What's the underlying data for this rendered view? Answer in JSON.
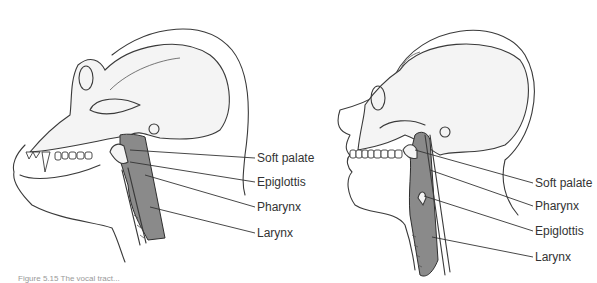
{
  "figure": {
    "panels": [
      {
        "id": "chimpanzee",
        "subject": "Chimpanzee head, sagittal view",
        "labels": [
          {
            "text": "Soft palate",
            "x": 257,
            "y": 152
          },
          {
            "text": "Epiglottis",
            "x": 257,
            "y": 176
          },
          {
            "text": "Pharynx",
            "x": 257,
            "y": 201
          },
          {
            "text": "Larynx",
            "x": 257,
            "y": 227
          }
        ]
      },
      {
        "id": "human",
        "subject": "Human head, sagittal view",
        "labels": [
          {
            "text": "Soft palate",
            "x": 535,
            "y": 177
          },
          {
            "text": "Pharynx",
            "x": 535,
            "y": 200
          },
          {
            "text": "Epiglottis",
            "x": 535,
            "y": 225
          },
          {
            "text": "Larynx",
            "x": 535,
            "y": 251
          }
        ]
      }
    ],
    "caption": "Figure 5.15 The vocal tract..."
  },
  "colors": {
    "line": "#3a3a3a",
    "airway_fill": "#8a8a8a",
    "skull_fill": "#f4f4f4",
    "background": "#ffffff"
  }
}
